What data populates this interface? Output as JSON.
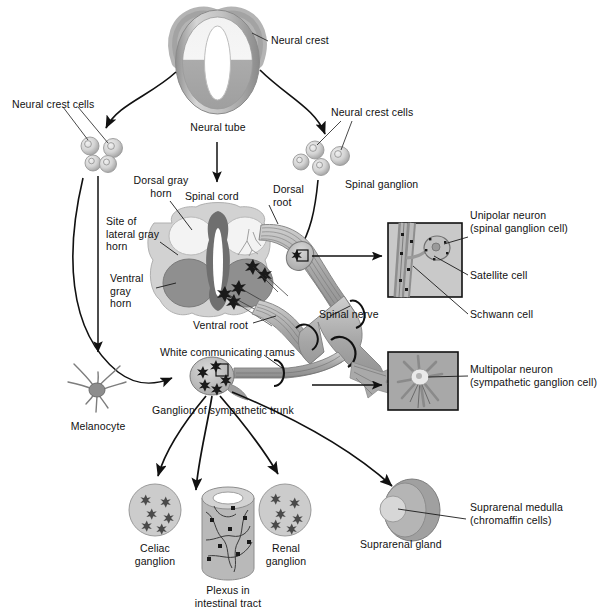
{
  "figure": {
    "type": "anatomical-diagram",
    "background_color": "#ffffff",
    "line_color": "#1a1a1a"
  },
  "palette": {
    "tissue_light": "#dcdcdc",
    "tissue_mid": "#b8b8b8",
    "tissue_dark": "#9a9a9a",
    "gray_matter_ventral": "#8f8f8f",
    "gray_matter_dorsal": "#ededed",
    "white_matter": "#cfcfcf",
    "canal_dark": "#6f6f6f",
    "nerve_gray": "#a9a9a9",
    "inset_bg": "#b0b0b0",
    "outline": "#2b2b2b"
  },
  "labels": {
    "neural_crest": "Neural crest",
    "neural_tube": "Neural tube",
    "neural_crest_cells_left": "Neural crest cells",
    "neural_crest_cells_right": "Neural crest cells",
    "dorsal_gray_horn": "Dorsal gray\nhorn",
    "spinal_cord": "Spinal cord",
    "dorsal_root": "Dorsal\nroot",
    "spinal_ganglion": "Spinal ganglion",
    "site_of_lateral_gray_horn": "Site of\nlateral gray\nhorn",
    "ventral_gray_horn": "Ventral\ngray\nhorn",
    "ventral_root": "Ventral root",
    "spinal_nerve": "Spinal nerve",
    "white_communicating_ramus": "White communicating ramus",
    "ganglion_of_sympathetic_trunk": "Ganglion of sympathetic trunk",
    "melanocyte": "Melanocyte",
    "unipolar_neuron": "Unipolar neuron\n(spinal ganglion cell)",
    "satellite_cell": "Satellite cell",
    "schwann_cell": "Schwann cell",
    "multipolar_neuron": "Multipolar neuron\n(sympathetic ganglion cell)",
    "celiac_ganglion": "Celiac\nganglion",
    "plexus_in_intestinal_tract": "Plexus in\nintestinal tract",
    "renal_ganglion": "Renal\nganglion",
    "suprarenal_gland": "Suprarenal gland",
    "suprarenal_medulla": "Suprarenal medulla\n(chromaffin cells)"
  },
  "structures": [
    {
      "id": "neural-tube",
      "label": "Neural tube",
      "shape": "oval-with-crest-hooks"
    },
    {
      "id": "neural-crest-cell-cluster-left",
      "label": "Neural crest cells",
      "count": 4
    },
    {
      "id": "neural-crest-cell-cluster-right",
      "label": "Neural crest cells",
      "count": 4
    },
    {
      "id": "spinal-cord-cross-section",
      "label": "Spinal cord"
    },
    {
      "id": "spinal-ganglion",
      "label": "Spinal ganglion"
    },
    {
      "id": "sympathetic-trunk-ganglion",
      "label": "Ganglion of sympathetic trunk"
    },
    {
      "id": "melanocyte",
      "label": "Melanocyte"
    },
    {
      "id": "celiac-ganglion",
      "label": "Celiac ganglion"
    },
    {
      "id": "intestinal-plexus",
      "label": "Plexus in intestinal tract"
    },
    {
      "id": "renal-ganglion",
      "label": "Renal ganglion"
    },
    {
      "id": "suprarenal-gland",
      "label": "Suprarenal gland"
    }
  ],
  "insets": [
    {
      "id": "spinal-ganglion-inset",
      "labels": [
        "Unipolar neuron (spinal ganglion cell)",
        "Satellite cell",
        "Schwann cell"
      ]
    },
    {
      "id": "sympathetic-neuron-inset",
      "labels": [
        "Multipolar neuron (sympathetic ganglion cell)"
      ]
    }
  ]
}
